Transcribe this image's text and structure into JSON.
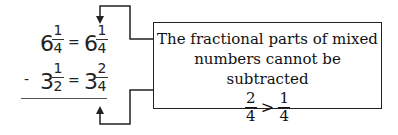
{
  "equation": {
    "row1": {
      "left_whole": "6",
      "left_num": "1",
      "left_den": "4",
      "eq": "=",
      "right_whole": "6",
      "right_num": "1",
      "right_den": "4"
    },
    "row2": {
      "operator": "-",
      "left_whole": "3",
      "left_num": "1",
      "left_den": "2",
      "eq": "=",
      "right_whole": "3",
      "right_num": "2",
      "right_den": "4"
    }
  },
  "callout": {
    "line1": "The fractional parts of mixed",
    "line2": "numbers cannot be subtracted",
    "ineq": {
      "left_num": "2",
      "left_den": "4",
      "symbol": ">",
      "right_num": "1",
      "right_den": "4"
    }
  },
  "arrows": {
    "top": "arrow-down-to-row1",
    "bottom": "arrow-up-to-row2"
  }
}
